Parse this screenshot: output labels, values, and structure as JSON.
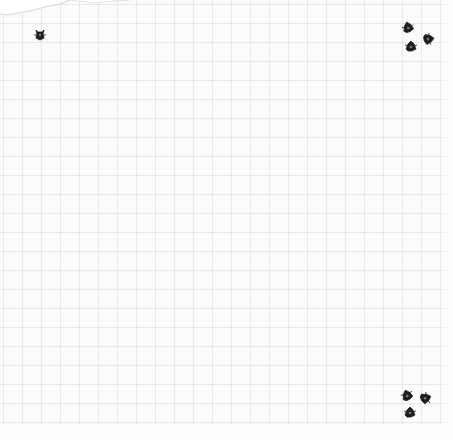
{
  "scene": {
    "description": "Scanned sheet of grid paper with small bug marks in the corners",
    "paper_color": "#fbfbfb",
    "grid_color": "#c8c8cd",
    "bug_color": "#1e1e1e"
  },
  "bugs": [
    {
      "name": "bug-top-left",
      "icon": "bug-icon"
    },
    {
      "name": "bug-top-right-1",
      "icon": "bug-icon"
    },
    {
      "name": "bug-top-right-2",
      "icon": "bug-icon"
    },
    {
      "name": "bug-top-right-3",
      "icon": "bug-icon"
    },
    {
      "name": "bug-bottom-right-1",
      "icon": "bug-icon"
    },
    {
      "name": "bug-bottom-right-2",
      "icon": "bug-icon"
    },
    {
      "name": "bug-bottom-right-3",
      "icon": "bug-icon"
    }
  ]
}
